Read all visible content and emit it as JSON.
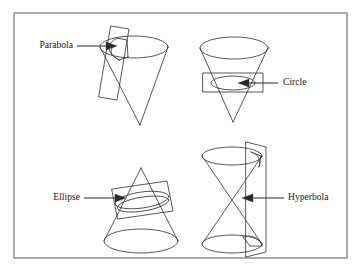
{
  "figure": {
    "background_color": "#ffffff",
    "frame": {
      "name": "outer-border",
      "x": 14,
      "y": 13,
      "width": 333,
      "height": 245,
      "stroke_color": "#6e6e6e",
      "stroke_width": 1.15
    },
    "line_color": "#3a3a3a",
    "text_color": "#1a1a1a"
  },
  "panels": [
    {
      "id": "parabola",
      "label": "Parabola",
      "label_anchor": "end",
      "label_x": 73,
      "label_y": 46,
      "cone_type": "single-inverted",
      "plane_type": "near-vertical-tilted",
      "description": "Inverted cone cut by a plane parallel to a generating line"
    },
    {
      "id": "circle",
      "label": "Circle",
      "label_anchor": "start",
      "label_x": 283,
      "label_y": 83,
      "cone_type": "single-inverted",
      "plane_type": "horizontal",
      "description": "Inverted cone cut by a plane perpendicular to the axis"
    },
    {
      "id": "ellipse",
      "label": "Ellipse",
      "label_anchor": "end",
      "label_x": 80,
      "label_y": 198,
      "cone_type": "single-upright",
      "plane_type": "oblique-tilted",
      "description": "Upright cone cut by an oblique plane"
    },
    {
      "id": "hyperbola",
      "label": "Hyperbola",
      "label_anchor": "start",
      "label_x": 288,
      "label_y": 198,
      "cone_type": "double-nappe",
      "plane_type": "vertical",
      "description": "Double cone cut by a plane parallel to the axis"
    }
  ],
  "leaders": [
    {
      "id": "parabola-leader",
      "x1": 77,
      "y1": 46,
      "x2": 110,
      "y2": 46,
      "arrow_at": "end"
    },
    {
      "id": "circle-leader",
      "x1": 278,
      "y1": 83,
      "x2": 238,
      "y2": 83,
      "arrow_at": "end"
    },
    {
      "id": "ellipse-leader",
      "x1": 84,
      "y1": 198,
      "x2": 125,
      "y2": 198,
      "arrow_at": "end"
    },
    {
      "id": "hyperbola-leader",
      "x1": 284,
      "y1": 198,
      "x2": 242,
      "y2": 198,
      "arrow_at": "end"
    }
  ]
}
